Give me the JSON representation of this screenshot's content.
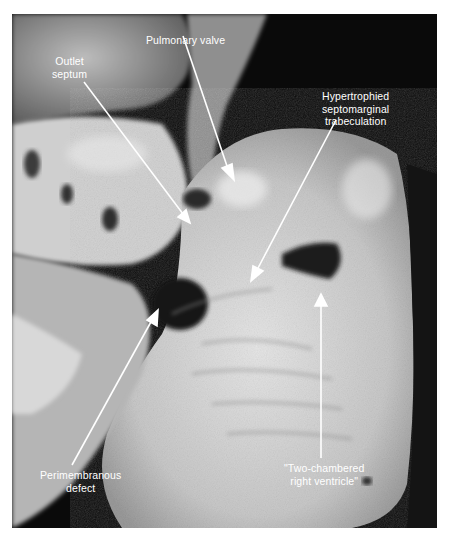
{
  "figure": {
    "labels": [
      {
        "id": "pulmonary-valve",
        "text": "Pulmonary valve"
      },
      {
        "id": "outlet-septum",
        "text": "Outlet\nseptum"
      },
      {
        "id": "septomarginal-trabeculation",
        "text": "Hypertrophied\nseptomarginal\ntrabeculation"
      },
      {
        "id": "perimembranous-defect",
        "text": "Perimembranous\ndefect"
      },
      {
        "id": "two-chambered-rv",
        "text": "\"Two-chambered\nright ventricle\""
      }
    ],
    "colors": {
      "background": "#ffffff",
      "photo_dark": "#0a0a0a",
      "tissue_light": "#d9d9d9",
      "annotation": "#ffffff"
    }
  }
}
